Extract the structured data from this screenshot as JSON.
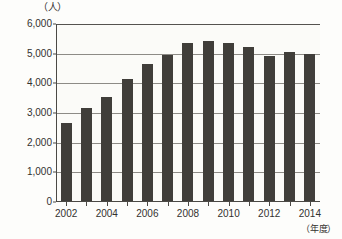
{
  "chart_data": {
    "type": "bar",
    "title": "",
    "subtitle": "",
    "xlabel": "（年度）",
    "ylabel": "（人）",
    "categories": [
      "2002",
      "2003",
      "2004",
      "2005",
      "2006",
      "2007",
      "2008",
      "2009",
      "2010",
      "2011",
      "2012",
      "2013",
      "2014"
    ],
    "visible_x_tick_labels": [
      "2002",
      "",
      "2004",
      "",
      "2006",
      "",
      "2008",
      "",
      "2010",
      "",
      "2012",
      "",
      "2014"
    ],
    "values": [
      2680,
      3180,
      3530,
      4150,
      4640,
      4950,
      5370,
      5440,
      5370,
      5230,
      4920,
      5040,
      5000
    ],
    "series": [
      {
        "name": "人数",
        "values": [
          2680,
          3180,
          3530,
          4150,
          4640,
          4950,
          5370,
          5440,
          5370,
          5230,
          4920,
          5040,
          5000
        ]
      }
    ],
    "ylim": [
      0,
      6000
    ],
    "y_ticks": [
      0,
      1000,
      2000,
      3000,
      4000,
      5000,
      6000
    ],
    "y_tick_labels": [
      "0",
      "1,000",
      "2,000",
      "3,000",
      "4,000",
      "5,000",
      "6,000"
    ],
    "grid": "horizontal",
    "legend": "none",
    "bar_color": "#403e3a",
    "axis_color": "#4b4945",
    "grid_color": "#8d8b86",
    "background_color": "#fbfbf8"
  }
}
